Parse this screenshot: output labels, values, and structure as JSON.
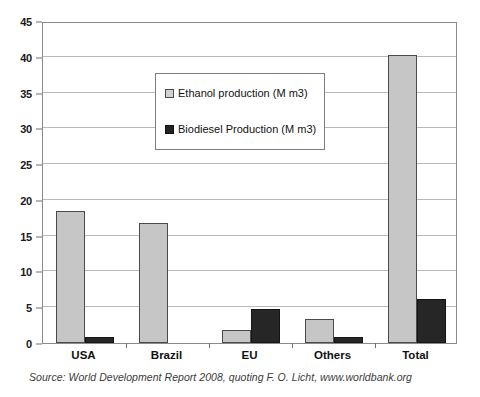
{
  "chart_data": {
    "type": "bar",
    "title": "",
    "subtitle": "",
    "xlabel": "",
    "ylabel": "",
    "categories": [
      "USA",
      "Brazil",
      "EU",
      "Others",
      "Total"
    ],
    "series": [
      {
        "name": "Ethanol production (M m3)",
        "color": "#c6c6c6",
        "values": [
          18.4,
          16.8,
          1.8,
          3.4,
          40.2
        ]
      },
      {
        "name": "Biodiesel Production (M m3)",
        "color": "#262626",
        "values": [
          0.8,
          0,
          4.7,
          0.9,
          6.2
        ]
      }
    ],
    "ylim": [
      0,
      45
    ],
    "yticks": [
      0,
      5,
      10,
      15,
      20,
      25,
      30,
      35,
      40,
      45
    ],
    "ytick_labels": [
      "0",
      "5",
      "10",
      "15",
      "20",
      "25",
      "30",
      "35",
      "40",
      "45"
    ],
    "grid": true,
    "grid_axis": "y",
    "legend_position": "upper center"
  },
  "legend": {
    "entries": [
      {
        "label": "Ethanol production (M m3)",
        "swatch": "light-gray-square"
      },
      {
        "label": "Biodiesel Production (M m3)",
        "swatch": "dark-square"
      }
    ]
  },
  "caption": {
    "source": "Source: World Development Report 2008, quoting F. O. Licht, www.worldbank.org"
  }
}
